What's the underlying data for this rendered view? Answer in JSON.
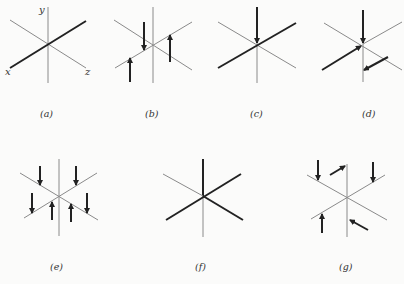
{
  "figure": {
    "panels": [
      {
        "id": "a",
        "caption": "(a)",
        "axis_labels": {
          "y": "y",
          "x": "x",
          "z": "z"
        },
        "description": "Cartesian axes, x-axis drawn bold"
      },
      {
        "id": "b",
        "caption": "(b)",
        "description": "Three vertical force arrows on thin axes"
      },
      {
        "id": "c",
        "caption": "(c)",
        "description": "Downward arrow on y-axis to origin, bold x-axis"
      },
      {
        "id": "d",
        "caption": "(d)",
        "description": "Downward arrow on y-axis, bold arrows along x direction"
      },
      {
        "id": "e",
        "caption": "(e)",
        "description": "Six vertical arrows, three up three down"
      },
      {
        "id": "f",
        "caption": "(f)",
        "description": "Bold y upper and bold crossing axes"
      },
      {
        "id": "g",
        "caption": "(g)",
        "description": "Vertical and oblique arrows around axes"
      }
    ]
  }
}
